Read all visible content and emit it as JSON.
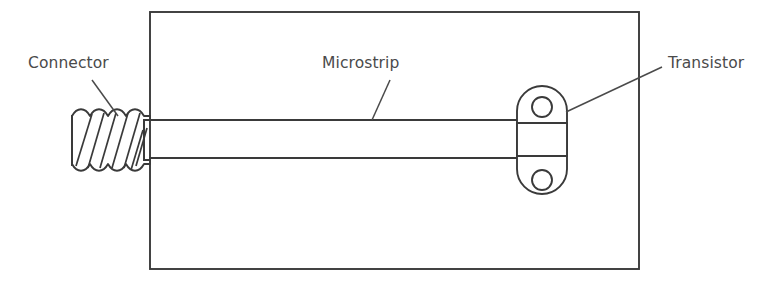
{
  "figure": {
    "background_color": "#ffffff",
    "line_color": "#3a3a3a",
    "text_color": "#4a4a4a",
    "width": 782,
    "height": 286
  },
  "labels": {
    "connector": "Connector",
    "microstrip": "Microstrip",
    "transistor": "Transistor"
  },
  "components": {
    "substrate": {
      "name": "substrate-board",
      "x": 150,
      "y": 12,
      "width": 489,
      "height": 257
    },
    "connector": {
      "name": "threaded-connector",
      "x": 70,
      "y": 113,
      "width": 80,
      "height": 55,
      "thread_turns": 6
    },
    "microstrip": {
      "name": "microstrip-line",
      "x_start": 150,
      "x_end": 525,
      "y_top": 120,
      "y_bottom": 158
    },
    "transistor": {
      "name": "transistor-package",
      "x": 517,
      "y": 86,
      "width": 50,
      "height": 108,
      "holes": 2,
      "hole_radius": 10,
      "hole_top_cy": 107,
      "hole_bottom_cy": 180
    }
  },
  "leaders": {
    "connector": {
      "x1": 92,
      "y1": 80,
      "x2": 118,
      "y2": 116
    },
    "microstrip": {
      "x1": 390,
      "y1": 80,
      "x2": 372,
      "y2": 120
    },
    "transistor": {
      "x1": 662,
      "y1": 67,
      "x2": 566,
      "y2": 112
    }
  }
}
